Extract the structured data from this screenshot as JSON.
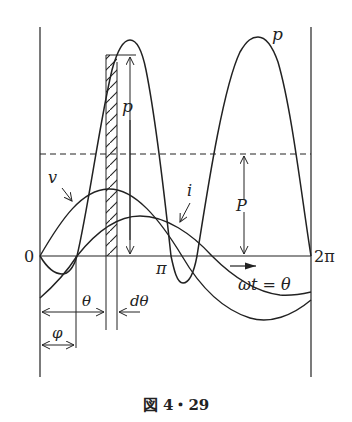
{
  "figure": {
    "caption": "図 4・29"
  },
  "labels": {
    "p_curve": "p",
    "p_instant": "p",
    "v_curve": "v",
    "i_curve": "i",
    "average_power": "P",
    "origin": "0",
    "pi": "π",
    "two_pi": "2π",
    "axis": "ωt = θ",
    "theta": "θ",
    "dtheta": "dθ",
    "phi": "φ"
  },
  "colors": {
    "ink": "#222222",
    "background": "#ffffff"
  }
}
